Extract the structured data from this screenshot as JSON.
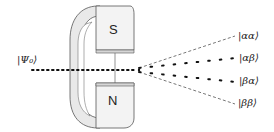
{
  "diagram": {
    "input_state": "|Ψ₀⟩",
    "magnet": {
      "south_pole_label": "S",
      "north_pole_label": "N",
      "fill_color": "#f2f2f2",
      "shade_color": "#c8c8c8",
      "outline_color": "#555555"
    },
    "output_states": [
      {
        "label": "|αα⟩",
        "style": "dashed"
      },
      {
        "label": "|αβ⟩",
        "style": "dotted"
      },
      {
        "label": "|βα⟩",
        "style": "dotted"
      },
      {
        "label": "|ββ⟩",
        "style": "dashed"
      }
    ],
    "beam_color": "#111111"
  }
}
